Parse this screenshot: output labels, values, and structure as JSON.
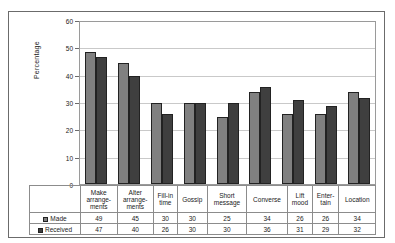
{
  "chart_data": {
    "type": "bar",
    "title": "",
    "xlabel": "",
    "ylabel": "Percentage",
    "ylim": [
      0,
      60
    ],
    "yticks": [
      0,
      10,
      20,
      30,
      40,
      50,
      60
    ],
    "grid": true,
    "legend_position": "table-left",
    "categories": [
      "Make arrange-ments",
      "Alter arrange-ments",
      "Fill-in time",
      "Gossip",
      "Short message",
      "Converse",
      "Lift mood",
      "Enter-tain",
      "Location"
    ],
    "category_lines": [
      [
        "Make",
        "arrange-",
        "ments"
      ],
      [
        "Alter",
        "arrange-",
        "ments"
      ],
      [
        "Fill-in",
        "time"
      ],
      [
        "Gossip"
      ],
      [
        "Short",
        "message"
      ],
      [
        "Converse"
      ],
      [
        "Lift",
        "mood"
      ],
      [
        "Enter-",
        "tain"
      ],
      [
        "Location"
      ]
    ],
    "series": [
      {
        "name": "Made",
        "color": "#808080",
        "values": [
          49,
          45,
          30,
          30,
          25,
          34,
          26,
          26,
          34
        ]
      },
      {
        "name": "Received",
        "color": "#3f3f3f",
        "values": [
          47,
          40,
          26,
          30,
          30,
          36,
          31,
          29,
          32
        ]
      }
    ]
  },
  "table": {
    "rows": [
      {
        "label": "Made",
        "swatch": "made-swatch"
      },
      {
        "label": "Received",
        "swatch": "received-swatch"
      }
    ]
  }
}
